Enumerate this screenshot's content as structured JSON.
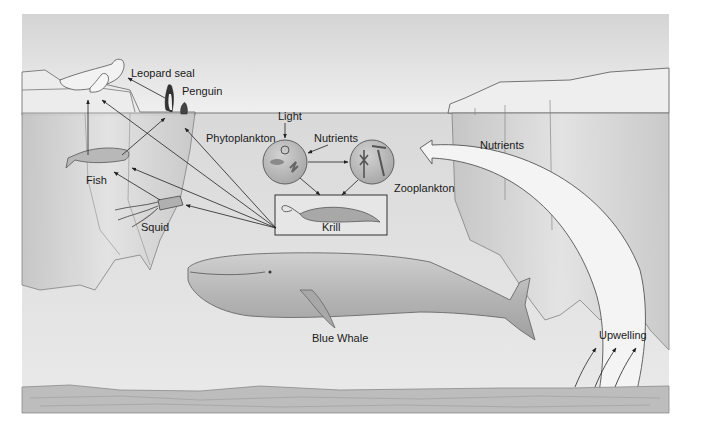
{
  "diagram": {
    "labels": {
      "leopard_seal": "Leopard seal",
      "penguin": "Penguin",
      "light": "Light",
      "phytoplankton": "Phytoplankton",
      "nutrients_top": "Nutrients",
      "nutrients_right": "Nutrients",
      "zooplankton": "Zooplankton",
      "fish": "Fish",
      "squid": "Squid",
      "krill": "Krill",
      "blue_whale": "Blue Whale",
      "upwelling": "Upwelling"
    },
    "nodes": [
      {
        "id": "leopard_seal",
        "label": "Leopard seal"
      },
      {
        "id": "penguin",
        "label": "Penguin"
      },
      {
        "id": "fish",
        "label": "Fish"
      },
      {
        "id": "squid",
        "label": "Squid"
      },
      {
        "id": "krill",
        "label": "Krill"
      },
      {
        "id": "phytoplankton",
        "label": "Phytoplankton"
      },
      {
        "id": "zooplankton",
        "label": "Zooplankton"
      },
      {
        "id": "blue_whale",
        "label": "Blue Whale"
      },
      {
        "id": "light",
        "label": "Light"
      },
      {
        "id": "nutrients",
        "label": "Nutrients"
      },
      {
        "id": "upwelling",
        "label": "Upwelling"
      }
    ],
    "edges": [
      {
        "from": "light",
        "to": "phytoplankton"
      },
      {
        "from": "nutrients",
        "to": "phytoplankton"
      },
      {
        "from": "phytoplankton",
        "to": "zooplankton"
      },
      {
        "from": "phytoplankton",
        "to": "krill"
      },
      {
        "from": "zooplankton",
        "to": "krill"
      },
      {
        "from": "krill",
        "to": "leopard_seal"
      },
      {
        "from": "krill",
        "to": "penguin"
      },
      {
        "from": "krill",
        "to": "fish"
      },
      {
        "from": "krill",
        "to": "squid"
      },
      {
        "from": "fish",
        "to": "leopard_seal"
      },
      {
        "from": "fish",
        "to": "penguin"
      },
      {
        "from": "squid",
        "to": "fish"
      },
      {
        "from": "penguin",
        "to": "leopard_seal"
      },
      {
        "from": "upwelling",
        "to": "nutrients"
      }
    ],
    "colors": {
      "sky": "#e6e6e6",
      "water": "#dcdcdc",
      "ice": "#cfcfcf",
      "line": "#333333",
      "seafloor": "#b8b8b8"
    }
  }
}
